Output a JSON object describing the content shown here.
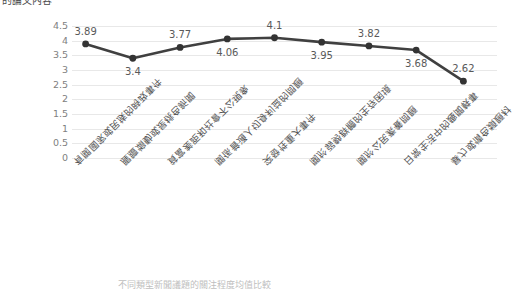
{
  "header_text": "的論文內容",
  "bottom_caption": "不同類型新聞議題的關注程度均值比較",
  "chart_data": {
    "type": "line",
    "title": "",
    "xlabel": "",
    "ylabel": "",
    "ylim": [
      0,
      4.5
    ],
    "ytick_step": 0.5,
    "grid": true,
    "legend": false,
    "legend_position": "none",
    "line_color": "#404040",
    "marker_color": "#333333",
    "gridline_color": "#e8e8e8",
    "ytick_labels": [
      "4.5",
      "4",
      "3.5",
      "3",
      "2.5",
      "2",
      "1.5",
      "1",
      "0.5",
      "0"
    ],
    "ytick_values": [
      4.5,
      4,
      3.5,
      3,
      2.5,
      2,
      1.5,
      1,
      0.5,
      0
    ],
    "categories": [
      "有關國家或民族的時政事件",
      "腥膻煽動或是桃色新聞",
      "貧富差距和社會不公現象",
      "關係普通人切身利益的問題",
      "突發性重大事件",
      "關於弱勢群體的生存困境",
      "關於公民素養問題",
      "日常生活中的趣聞軼事",
      "暴力或情色類題材"
    ],
    "values": [
      3.89,
      3.4,
      3.77,
      4.06,
      4.1,
      3.95,
      3.82,
      3.68,
      2.62
    ],
    "value_labels": [
      "3.89",
      "3.4",
      "3.77",
      "4.06",
      "4.1",
      "3.95",
      "3.82",
      "3.68",
      "2.62"
    ],
    "label_positions": [
      "above",
      "below",
      "above",
      "below",
      "above",
      "below",
      "above",
      "below",
      "above"
    ]
  }
}
